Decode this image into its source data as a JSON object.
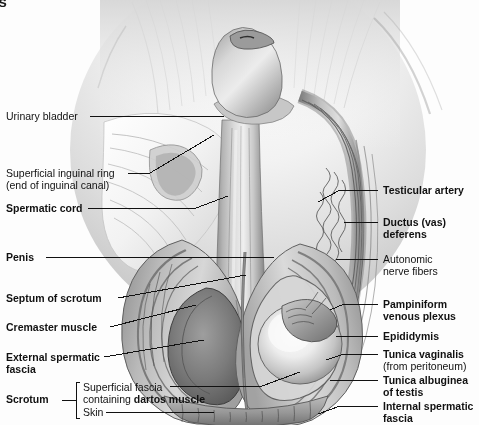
{
  "page": {
    "background_color": "#fdfdfd",
    "width": 479,
    "height": 425,
    "cropped_heading_fragment": "es"
  },
  "illustration": {
    "name": "male-scrotum-anatomy-illustration",
    "style": "grayscale-airbrush-medical-drawing",
    "palette": {
      "lightest": "#fbfbfb",
      "light": "#e3e3e3",
      "mid": "#b8b8b8",
      "dark": "#7d7d7d",
      "darkest": "#3d3d3d",
      "line": "#111111"
    },
    "description": "Anterior view dissection of the penis, spermatic cord and scrotum with the left side opened to show the testis and coverings"
  },
  "labels_left": [
    {
      "id": "urinary-bladder",
      "text": "Urinary bladder",
      "bold": false,
      "sub": null,
      "x": 6,
      "y": 111
    },
    {
      "id": "superficial-inguinal-ring",
      "text": "Superficial inguinal ring",
      "bold": false,
      "sub": "(end of inguinal canal)",
      "x": 6,
      "y": 168
    },
    {
      "id": "spermatic-cord",
      "text": "Spermatic cord",
      "bold": true,
      "sub": null,
      "x": 6,
      "y": 203
    },
    {
      "id": "penis",
      "text": "Penis",
      "bold": true,
      "sub": null,
      "x": 6,
      "y": 252
    },
    {
      "id": "septum-of-scrotum",
      "text": "Septum of scrotum",
      "bold": true,
      "sub": null,
      "x": 6,
      "y": 293
    },
    {
      "id": "cremaster-muscle",
      "text": "Cremaster muscle",
      "bold": true,
      "sub": null,
      "x": 6,
      "y": 322
    },
    {
      "id": "external-spermatic-fascia",
      "text": "External spermatic",
      "bold": true,
      "sub": "fascia",
      "x": 6,
      "y": 352
    }
  ],
  "scrotum_group": {
    "id": "scrotum",
    "label": "Scrotum",
    "bold": true,
    "x": 6,
    "y": 394,
    "bracket": {
      "x": 76,
      "top": 381,
      "bottom": 419
    },
    "items": [
      {
        "id": "superficial-fascia-dartos",
        "line1": "Superficial fascia",
        "line2_pre": "containing ",
        "line2_bold": "dartos muscle",
        "x": 83,
        "y": 382
      },
      {
        "id": "skin",
        "line1": "Skin",
        "line2_pre": null,
        "line2_bold": null,
        "x": 83,
        "y": 407
      }
    ]
  },
  "labels_right": [
    {
      "id": "testicular-artery",
      "text": "Testicular artery",
      "bold": true,
      "sub": null,
      "x": 383,
      "y": 185
    },
    {
      "id": "ductus-vas-deferens",
      "text": "Ductus (vas)",
      "bold": true,
      "sub": "deferens",
      "sub_bold": true,
      "x": 383,
      "y": 217
    },
    {
      "id": "autonomic-nerve-fibers",
      "text": "Autonomic",
      "bold": false,
      "sub": "nerve fibers",
      "sub_bold": false,
      "x": 383,
      "y": 254
    },
    {
      "id": "pampiniform-venous-plexus",
      "text": "Pampiniform",
      "bold": true,
      "sub": "venous plexus",
      "sub_bold": true,
      "x": 383,
      "y": 299
    },
    {
      "id": "epididymis",
      "text": "Epididymis",
      "bold": true,
      "sub": null,
      "x": 383,
      "y": 331
    },
    {
      "id": "tunica-vaginalis",
      "text": "Tunica vaginalis",
      "bold": true,
      "sub": "(from peritoneum)",
      "sub_bold": false,
      "x": 383,
      "y": 349
    },
    {
      "id": "tunica-albuginea-of-testis",
      "text": "Tunica albuginea",
      "bold": true,
      "sub": "of testis",
      "sub_bold": true,
      "x": 383,
      "y": 375
    },
    {
      "id": "internal-spermatic-fascia",
      "text": "Internal spermatic",
      "bold": true,
      "sub": "fascia",
      "sub_bold": true,
      "x": 383,
      "y": 401
    }
  ]
}
